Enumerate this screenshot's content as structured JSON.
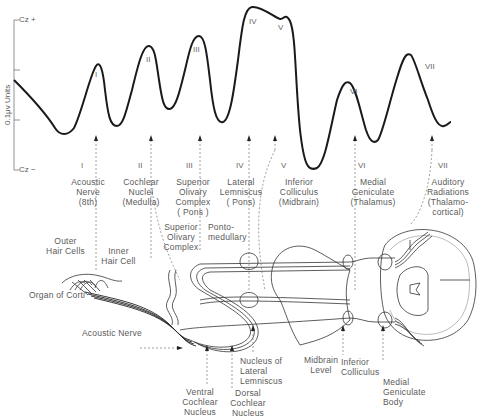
{
  "axis": {
    "top_label": "Cz +",
    "bottom_label": "Cz −",
    "y_label": "0.1μv Units"
  },
  "waveform_peaks": [
    "I",
    "II",
    "III",
    "IV",
    "V",
    "VI",
    "VII"
  ],
  "components": [
    {
      "numeral": "I",
      "label": "Acoustic\nNerve\n(8th)"
    },
    {
      "numeral": "II",
      "label": "Cochlear\nNuclei\n(Medulla)"
    },
    {
      "numeral": "III",
      "label": "Superior\nOlivary\nComplex\n( Pons )"
    },
    {
      "numeral": "IV",
      "label": "Lateral\nLemniscus\n( Pons)"
    },
    {
      "numeral": "V",
      "label": "Inferior\nColliculus\n(Midbrain)"
    },
    {
      "numeral": "VI",
      "label": "Medial\nGeniculate\n(Thalamus)"
    },
    {
      "numeral": "VII",
      "label": "Auditory\nRadiations\n(Thalamo-\ncortical)"
    }
  ],
  "anatomy": {
    "outer_hair_cells": "Outer\nHair Cells",
    "inner_hair_cell": "Inner\nHair Cell",
    "organ_of_corti": "Organ of Corti",
    "acoustic_nerve": "Acoustic Nerve",
    "superior_olivary_complex": "Superior\nOlivary\nComplex",
    "pontomedullary": "Ponto-\nmedullary",
    "ventral_cochlear_nucleus": "Ventral\nCochlear\nNucleus",
    "dorsal_cochlear_nucleus": "Dorsal\nCochlear\nNucleus",
    "nucleus_lateral_lemniscus": "Nucleus of\nLateral\nLemniscus",
    "midbrain_level": "Midbrain\nLevel",
    "inferior_colliculus": "Inferior\nColliculus",
    "medial_geniculate_body": "Medial\nGeniculate\nBody"
  }
}
